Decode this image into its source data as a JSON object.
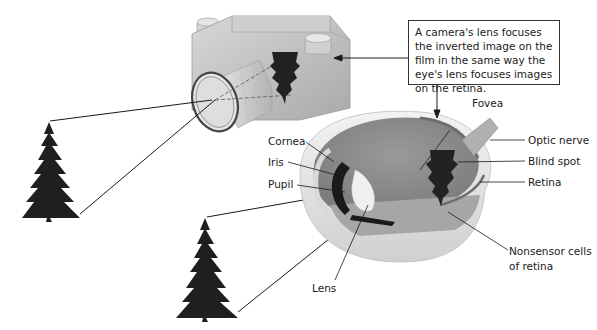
{
  "callout": {
    "text": "A camera's lens focuses the inverted image on the film in the same way the eye's lens focuses images on the retina."
  },
  "labels": {
    "cornea": "Cornea",
    "iris": "Iris",
    "pupil": "Pupil",
    "lens": "Lens",
    "fovea": "Fovea",
    "optic_nerve": "Optic nerve",
    "blind_spot": "Blind spot",
    "retina": "Retina",
    "nonsensor_line1": "Nonsensor cells",
    "nonsensor_line2": "of retina"
  },
  "colors": {
    "camera_body": "#c9c9c9",
    "eye_interior": "#8e8e8e",
    "tree": "#1f1f1f",
    "line": "#1a1a1a"
  }
}
